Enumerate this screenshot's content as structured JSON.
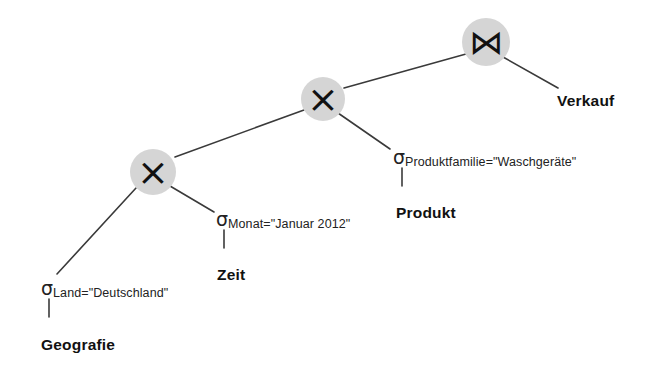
{
  "diagram": {
    "background_color": "#ffffff",
    "node_fill": "#d5d5d5",
    "edge_color": "#3a3a3a",
    "text_color": "#1a1a1a"
  },
  "operators": [
    {
      "id": "join-top",
      "symbol": "⋈",
      "name": "join",
      "x": 486,
      "y": 42,
      "r": 24
    },
    {
      "id": "cross-mid",
      "symbol": "×",
      "name": "cross-product",
      "x": 323,
      "y": 99,
      "r": 22
    },
    {
      "id": "cross-left",
      "symbol": "×",
      "name": "cross-product",
      "x": 153,
      "y": 172,
      "r": 23
    }
  ],
  "selections": [
    {
      "id": "sel-produkt",
      "sigma": "σ",
      "predicate": "Produktfamilie=\"Waschgeräte\"",
      "x": 393,
      "y": 146
    },
    {
      "id": "sel-zeit",
      "sigma": "σ",
      "predicate": "Monat=\"Januar 2012\"",
      "x": 216,
      "y": 208
    },
    {
      "id": "sel-geografie",
      "sigma": "σ",
      "predicate": "Land=\"Deutschland\"",
      "x": 41,
      "y": 277
    }
  ],
  "relations": [
    {
      "id": "rel-verkauf",
      "label": "Verkauf",
      "x": 557,
      "y": 92
    },
    {
      "id": "rel-produkt",
      "label": "Produkt",
      "x": 396,
      "y": 204
    },
    {
      "id": "rel-zeit",
      "label": "Zeit",
      "x": 217,
      "y": 266
    },
    {
      "id": "rel-geografie",
      "label": "Geografie",
      "x": 41,
      "y": 336
    }
  ]
}
